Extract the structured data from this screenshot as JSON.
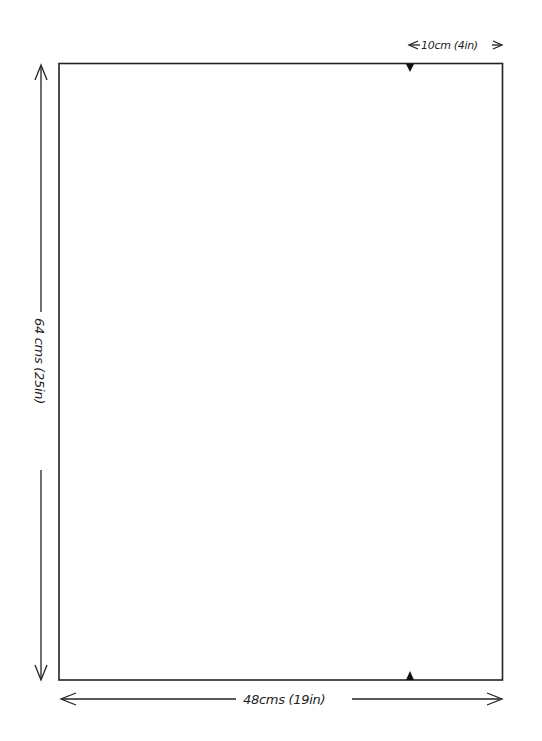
{
  "diagram": {
    "type": "pattern-dimensions",
    "shape": "rectangle",
    "colors": {
      "background": "#ffffff",
      "stroke": "#222222"
    },
    "dimensions": {
      "width_label": "48cms (19in)",
      "height_label": "64 cms (25in)",
      "offset_label": "10cm (4in)"
    },
    "markers": [
      {
        "name": "top-notch",
        "position": "top-edge",
        "direction": "down"
      },
      {
        "name": "bottom-notch",
        "position": "bottom-edge",
        "direction": "up"
      }
    ]
  }
}
